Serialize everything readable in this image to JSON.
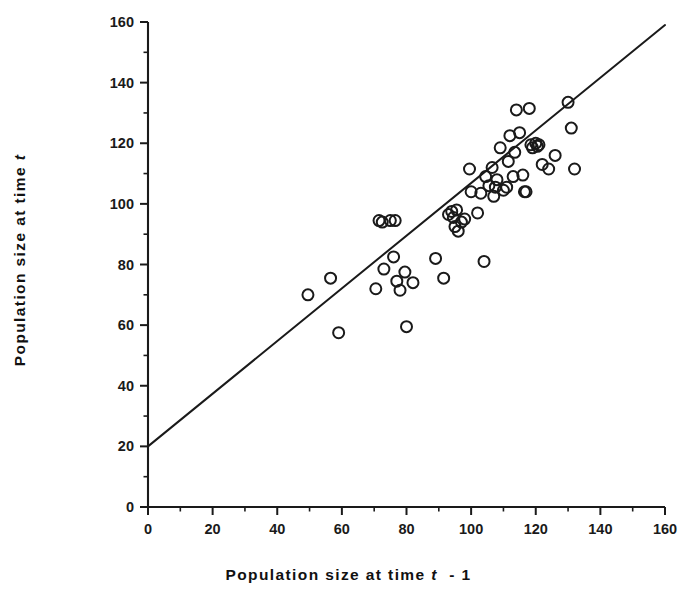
{
  "chart_data": {
    "type": "scatter",
    "title": "",
    "xlabel": "Population  size  at  time  t  - 1",
    "ylabel": "Population  size  at  time  t",
    "xlim": [
      0,
      160
    ],
    "ylim": [
      0,
      160
    ],
    "xticks": [
      0,
      20,
      40,
      60,
      80,
      100,
      120,
      140,
      160
    ],
    "yticks": [
      0,
      20,
      40,
      60,
      80,
      100,
      120,
      140,
      160
    ],
    "xtick_labels": [
      "0",
      "20",
      "40",
      "60",
      "80",
      "100",
      "120",
      "140",
      "160"
    ],
    "ytick_labels": [
      "0",
      "20",
      "40",
      "60",
      "80",
      "100",
      "120",
      "140",
      "160"
    ],
    "minor_tick_step": 10,
    "grid": false,
    "legend": null,
    "marker": "open-circle",
    "marker_color": "#1a1a1a",
    "marker_size": 11,
    "line_color": "#1a1a1a",
    "series": [
      {
        "name": "Population size pairs",
        "points": [
          [
            49.5,
            70.0
          ],
          [
            56.5,
            75.5
          ],
          [
            59.0,
            57.5
          ],
          [
            70.5,
            72.0
          ],
          [
            71.5,
            94.5
          ],
          [
            72.5,
            94.0
          ],
          [
            73.0,
            78.5
          ],
          [
            75.0,
            94.5
          ],
          [
            76.5,
            94.5
          ],
          [
            76.0,
            82.5
          ],
          [
            77.0,
            74.5
          ],
          [
            78.0,
            71.5
          ],
          [
            79.5,
            77.5
          ],
          [
            80.0,
            59.5
          ],
          [
            82.0,
            74.0
          ],
          [
            89.0,
            82.0
          ],
          [
            91.5,
            75.5
          ],
          [
            93.0,
            96.5
          ],
          [
            94.0,
            97.5
          ],
          [
            94.5,
            95.5
          ],
          [
            95.0,
            92.5
          ],
          [
            95.5,
            98.0
          ],
          [
            96.0,
            91.0
          ],
          [
            97.0,
            94.0
          ],
          [
            98.0,
            95.0
          ],
          [
            99.5,
            111.5
          ],
          [
            100.0,
            104.0
          ],
          [
            102.0,
            97.0
          ],
          [
            103.0,
            103.5
          ],
          [
            104.0,
            81.0
          ],
          [
            104.5,
            109.0
          ],
          [
            105.5,
            106.0
          ],
          [
            106.5,
            112.0
          ],
          [
            107.0,
            102.5
          ],
          [
            107.5,
            105.5
          ],
          [
            108.0,
            108.0
          ],
          [
            109.0,
            118.5
          ],
          [
            110.0,
            104.5
          ],
          [
            111.0,
            105.5
          ],
          [
            111.5,
            114.0
          ],
          [
            112.0,
            122.5
          ],
          [
            113.0,
            109.0
          ],
          [
            113.5,
            117.0
          ],
          [
            114.0,
            131.0
          ],
          [
            115.0,
            123.5
          ],
          [
            116.0,
            109.5
          ],
          [
            116.5,
            104.0
          ],
          [
            117.0,
            104.0
          ],
          [
            118.0,
            131.5
          ],
          [
            118.5,
            119.5
          ],
          [
            119.0,
            118.5
          ],
          [
            120.0,
            120.0
          ],
          [
            120.5,
            119.0
          ],
          [
            121.0,
            119.5
          ],
          [
            122.0,
            113.0
          ],
          [
            124.0,
            111.5
          ],
          [
            126.0,
            116.0
          ],
          [
            130.0,
            133.5
          ],
          [
            131.0,
            125.0
          ],
          [
            132.0,
            111.5
          ]
        ]
      }
    ],
    "fit_line": {
      "name": "regression-line",
      "x_start": 0,
      "y_start": 20,
      "x_end": 160,
      "y_end": 159
    }
  },
  "axis": {
    "x_label_prefix": "Population  size  at  time",
    "x_label_italic": "t",
    "x_label_suffix": "- 1",
    "y_label_prefix": "Population  size  at  time",
    "y_label_italic": "t"
  }
}
